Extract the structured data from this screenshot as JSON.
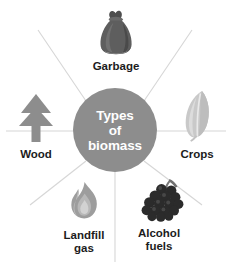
{
  "diagram": {
    "type": "radial-hub-and-spoke",
    "title": "Types of biomass",
    "background_color": "#ffffff",
    "hub": {
      "label_lines": [
        "Types",
        "of",
        "biomass"
      ],
      "line1": "Types",
      "line2": "of",
      "line3": "biomass",
      "fill_color": "#8d8d8d",
      "text_color": "#ffffff"
    },
    "spoke_color": "#d6d6d6",
    "label_color": "#1c1c1c",
    "nodes": [
      {
        "id": "garbage",
        "label": "Garbage",
        "icon": "garbage-bag-icon",
        "icon_color": "#595959",
        "position": "top"
      },
      {
        "id": "wood",
        "label": "Wood",
        "icon": "pine-tree-icon",
        "icon_color": "#8d8d8d",
        "position": "left"
      },
      {
        "id": "crops",
        "label": "Crops",
        "icon": "leaf-icon",
        "icon_color": "#c4c4c4",
        "position": "right"
      },
      {
        "id": "landfill-gas",
        "label": "Landfill\ngas",
        "icon": "flame-icon",
        "icon_color": "#9a9a9a",
        "position": "bottom-left"
      },
      {
        "id": "alcohol-fuels",
        "label": "Alcohol\nfuels",
        "icon": "grapes-icon",
        "icon_color": "#2b2b2b",
        "position": "bottom-right"
      }
    ]
  }
}
